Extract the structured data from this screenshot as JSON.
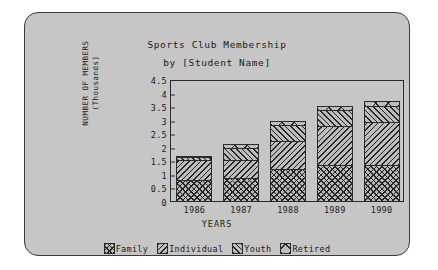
{
  "chart_data": {
    "type": "bar",
    "subtype": "stacked-bar",
    "title": "Sports Club Membership",
    "subtitle": "by [Student Name]",
    "xlabel": "YEARS",
    "ylabel": "NUMBER OF MEMBERS",
    "ylabel_line2": "(Thousands)",
    "categories": [
      "1986",
      "1987",
      "1988",
      "1989",
      "1990"
    ],
    "ylim": [
      0,
      4.5
    ],
    "yticks": [
      "0",
      "0.5",
      "1",
      "1.5",
      "2",
      "2.5",
      "3",
      "3.5",
      "4",
      "4.5"
    ],
    "ytick_values": [
      0,
      0.5,
      1,
      1.5,
      2,
      2.5,
      3,
      3.5,
      4,
      4.5
    ],
    "grid": false,
    "legend_position": "bottom",
    "series": [
      {
        "name": "Family",
        "pattern": "cross-hatch",
        "values": [
          0.8,
          0.9,
          1.22,
          1.35,
          1.35
        ]
      },
      {
        "name": "Individual",
        "pattern": "backslash-hatch",
        "values": [
          0.8,
          0.7,
          1.08,
          1.5,
          1.65
        ]
      },
      {
        "name": "Youth",
        "pattern": "slash-hatch",
        "values": [
          0.15,
          0.45,
          0.6,
          0.6,
          0.63
        ]
      },
      {
        "name": "Retired",
        "pattern": "x-mark",
        "values": [
          0.05,
          0.2,
          0.2,
          0.2,
          0.22
        ]
      }
    ],
    "totals": [
      1.8,
      2.25,
      3.1,
      3.65,
      3.85
    ]
  },
  "colors": {
    "panel_background": "#c6c6c6",
    "page_background": "#ffffff",
    "ink": "#1a1a1a",
    "frame": "#2b2b2b"
  }
}
